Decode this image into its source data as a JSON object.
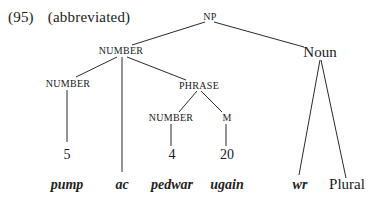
{
  "caption": {
    "example_number": "(95)",
    "note": "(abbreviated)"
  },
  "tree": {
    "root": "NP",
    "nodes": {
      "np": "NP",
      "number_top": "NUMBER",
      "noun": "Noun",
      "number_left": "NUMBER",
      "phrase": "PHRASE",
      "number_phrase": "NUMBER",
      "m": "M"
    },
    "numerals": {
      "five": "5",
      "four": "4",
      "twenty": "20"
    },
    "leaves": {
      "pump": "pump",
      "ac": "ac",
      "pedwar": "pedwar",
      "ugain": "ugain",
      "wr": "wr",
      "plural": "Plural"
    },
    "structure": [
      {
        "parent": "NP",
        "children": [
          "NUMBER",
          "Noun"
        ]
      },
      {
        "parent": "NUMBER",
        "children": [
          "NUMBER",
          "ac",
          "PHRASE"
        ]
      },
      {
        "parent": "NUMBER",
        "children": [
          "5"
        ]
      },
      {
        "parent": "PHRASE",
        "children": [
          "NUMBER",
          "M"
        ]
      },
      {
        "parent": "NUMBER",
        "children": [
          "4"
        ]
      },
      {
        "parent": "M",
        "children": [
          "20"
        ]
      },
      {
        "parent": "Noun",
        "children": [
          "wr",
          "Plural"
        ]
      }
    ]
  }
}
